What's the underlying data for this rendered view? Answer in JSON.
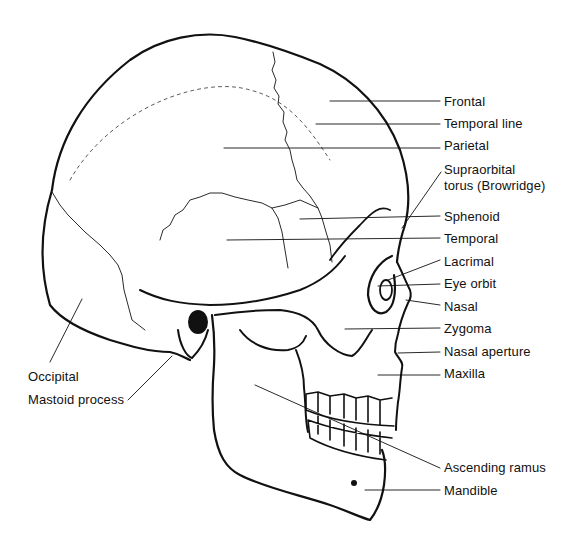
{
  "diagram": {
    "ink_color": "#111111",
    "background": "#ffffff",
    "labels_right": [
      {
        "id": "frontal",
        "text": "Frontal",
        "x": 444,
        "y": 94
      },
      {
        "id": "temporal-line",
        "text": "Temporal line",
        "x": 444,
        "y": 116
      },
      {
        "id": "parietal",
        "text": "Parietal",
        "x": 444,
        "y": 138
      },
      {
        "id": "supraorbital-1",
        "text": "Supraorbital",
        "x": 444,
        "y": 162
      },
      {
        "id": "supraorbital-2",
        "text": "torus (Browridge)",
        "x": 444,
        "y": 178
      },
      {
        "id": "sphenoid",
        "text": "Sphenoid",
        "x": 444,
        "y": 209
      },
      {
        "id": "temporal",
        "text": "Temporal",
        "x": 444,
        "y": 231
      },
      {
        "id": "lacrimal",
        "text": "Lacrimal",
        "x": 444,
        "y": 254
      },
      {
        "id": "eye-orbit",
        "text": "Eye orbit",
        "x": 444,
        "y": 276
      },
      {
        "id": "nasal",
        "text": "Nasal",
        "x": 444,
        "y": 299
      },
      {
        "id": "zygoma",
        "text": "Zygoma",
        "x": 444,
        "y": 321
      },
      {
        "id": "nasal-aperture",
        "text": "Nasal aperture",
        "x": 444,
        "y": 344
      },
      {
        "id": "maxilla",
        "text": "Maxilla",
        "x": 444,
        "y": 366
      },
      {
        "id": "ascending-ramus",
        "text": "Ascending ramus",
        "x": 444,
        "y": 460
      },
      {
        "id": "mandible",
        "text": "Mandible",
        "x": 444,
        "y": 483
      }
    ],
    "labels_left": [
      {
        "id": "occipital",
        "text": "Occipital",
        "x": 28,
        "y": 369
      },
      {
        "id": "mastoid-process",
        "text": "Mastoid process",
        "x": 28,
        "y": 392
      }
    ]
  }
}
